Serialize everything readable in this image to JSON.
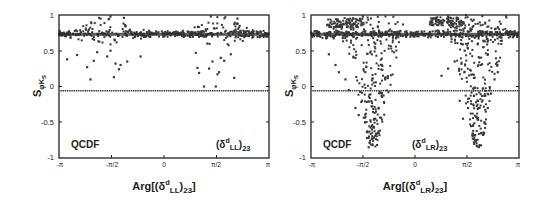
{
  "chart_data": [
    {
      "type": "scatter",
      "panel": "left",
      "title": "",
      "xlabel": "Arg[(δ^d_LL)_23]",
      "ylabel": "S_φKs",
      "xlim": [
        -3.14159,
        3.14159
      ],
      "ylim": [
        -1,
        1
      ],
      "x_ticks": [
        "-π",
        "-π/2",
        "0",
        "π/2",
        "π"
      ],
      "y_ticks": [
        "1",
        "0.5",
        "0",
        "-0.5",
        "-1"
      ],
      "annotations": [
        "QCDF",
        "(δ^d_LL)_23"
      ],
      "grid": false,
      "legend": null,
      "reference_lines": [
        {
          "name": "SM band",
          "y": 0.73,
          "style": "dense dark band"
        },
        {
          "name": "experimental",
          "y": -0.06,
          "style": "dotted"
        }
      ],
      "series": [
        {
          "name": "scan points",
          "description": "points concentrated near S=0.73 across all phases, spreading up to ~1 and down to ~0.1 around ±π/2",
          "points": [
            [
              -2.9,
              0.38
            ],
            [
              -2.6,
              0.44
            ],
            [
              -2.3,
              0.27
            ],
            [
              -2.2,
              0.1
            ],
            [
              -2.1,
              0.36
            ],
            [
              -2.0,
              0.48
            ],
            [
              -1.7,
              0.42
            ],
            [
              -1.6,
              0.5
            ],
            [
              -1.5,
              0.13
            ],
            [
              -1.45,
              0.32
            ],
            [
              -1.35,
              0.24
            ],
            [
              -1.3,
              0.3
            ],
            [
              -1.1,
              0.35
            ],
            [
              -0.7,
              0.42
            ],
            [
              -1.9,
              0.95
            ],
            [
              -1.6,
              0.98
            ],
            [
              -1.2,
              0.96
            ],
            [
              0.95,
              0.47
            ],
            [
              1.0,
              0.26
            ],
            [
              1.05,
              0.19
            ],
            [
              1.2,
              0.0
            ],
            [
              1.3,
              0.6
            ],
            [
              1.35,
              0.25
            ],
            [
              1.45,
              0.35
            ],
            [
              1.55,
              0.0
            ],
            [
              1.6,
              0.17
            ],
            [
              1.65,
              0.2
            ],
            [
              1.7,
              0.4
            ],
            [
              1.8,
              0.36
            ],
            [
              2.0,
              0.45
            ],
            [
              2.1,
              0.12
            ],
            [
              2.2,
              0.95
            ],
            [
              1.4,
              0.98
            ]
          ]
        }
      ]
    },
    {
      "type": "scatter",
      "panel": "right",
      "title": "",
      "xlabel": "Arg[(δ^d_LR)_23]",
      "ylabel": "S_φKs",
      "xlim": [
        -3.14159,
        3.14159
      ],
      "ylim": [
        -1,
        1
      ],
      "x_ticks": [
        "-π",
        "-π/2",
        "0",
        "π/2",
        "π"
      ],
      "y_ticks": [
        "1",
        "0.5",
        "0",
        "-0.5",
        "-1"
      ],
      "annotations": [
        "QCDF",
        "(δ^d_LR)_23"
      ],
      "grid": false,
      "legend": null,
      "reference_lines": [
        {
          "name": "SM band",
          "y": 0.73,
          "style": "dense dark band"
        },
        {
          "name": "experimental",
          "y": -0.06,
          "style": "dotted"
        }
      ],
      "series": [
        {
          "name": "scan points",
          "description": "two V-shaped lobes centered near -1.2 and +1.9 rad reaching S≈-0.85; dense cluster near S=1 around -2 and +1",
          "points": [
            [
              -2.6,
              0.45
            ],
            [
              -2.4,
              0.3
            ],
            [
              -2.3,
              0.2
            ],
            [
              -2.1,
              0.1
            ],
            [
              -2.0,
              -0.05
            ],
            [
              -1.8,
              -0.3
            ],
            [
              -1.7,
              -0.4
            ],
            [
              -1.6,
              -0.2
            ],
            [
              -1.5,
              -0.5
            ],
            [
              -1.45,
              -0.72
            ],
            [
              -1.4,
              -0.85
            ],
            [
              -1.3,
              -0.6
            ],
            [
              -1.2,
              -0.45
            ],
            [
              -1.1,
              -0.3
            ],
            [
              -1.0,
              -0.1
            ],
            [
              -0.9,
              0.1
            ],
            [
              -1.0,
              0.3
            ],
            [
              -1.5,
              0.2
            ],
            [
              -1.8,
              0.4
            ],
            [
              -1.2,
              0.6
            ],
            [
              0.8,
              0.15
            ],
            [
              1.0,
              0.25
            ],
            [
              1.2,
              0.35
            ],
            [
              1.35,
              -0.2
            ],
            [
              1.45,
              -0.45
            ],
            [
              1.6,
              -0.3
            ],
            [
              1.75,
              -0.55
            ],
            [
              1.85,
              -0.75
            ],
            [
              1.95,
              -0.82
            ],
            [
              2.0,
              -0.65
            ],
            [
              2.1,
              -0.5
            ],
            [
              2.2,
              -0.3
            ],
            [
              2.3,
              -0.1
            ],
            [
              2.4,
              0.1
            ],
            [
              2.5,
              0.2
            ],
            [
              2.2,
              0.45
            ],
            [
              1.9,
              0.6
            ],
            [
              1.5,
              0.5
            ]
          ]
        }
      ]
    }
  ],
  "panels": [
    {
      "ylabel_main": "S",
      "ylabel_sub": "φK",
      "ylabel_subsub": "S",
      "xlabel_pre": "Arg[(δ",
      "xlabel_sup": "d",
      "xlabel_sub": "LL",
      "xlabel_post": ")",
      "xlabel_sub2": "23",
      "xlabel_end": "]",
      "label_qcdf": "QCDF",
      "label_delta": "(δ",
      "label_delta_sup": "d",
      "label_delta_sub": "LL",
      "label_delta_close": ")",
      "label_delta_sub2": "23",
      "y_ticks": [
        "1",
        "0.5",
        "0",
        "-0.5",
        "-1"
      ],
      "x_ticks": [
        "-π",
        "-π/2",
        "0",
        "π/2",
        "π"
      ]
    },
    {
      "ylabel_main": "S",
      "ylabel_sub": "φK",
      "ylabel_subsub": "S",
      "xlabel_pre": "Arg[(δ",
      "xlabel_sup": "d",
      "xlabel_sub": "LR",
      "xlabel_post": ")",
      "xlabel_sub2": "23",
      "xlabel_end": "]",
      "label_qcdf": "QCDF",
      "label_delta": "(δ",
      "label_delta_sup": "d",
      "label_delta_sub": "LR",
      "label_delta_close": ")",
      "label_delta_sub2": "23",
      "y_ticks": [
        "1",
        "0.5",
        "0",
        "-0.5",
        "-1"
      ],
      "x_ticks": [
        "-π",
        "-π/2",
        "0",
        "π/2",
        "π"
      ]
    }
  ],
  "colors": {
    "points": "#3a3a3a",
    "frame": "#222222",
    "background": "#ffffff"
  }
}
